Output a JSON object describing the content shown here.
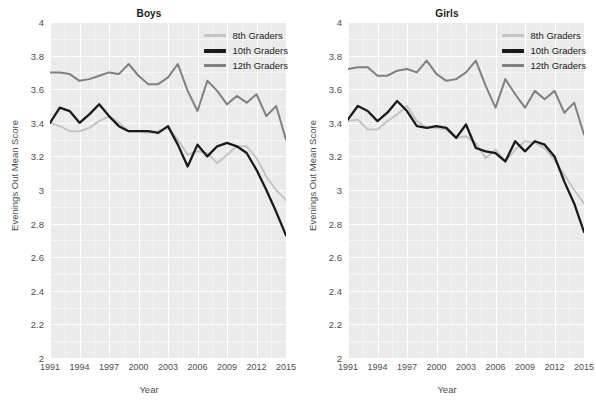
{
  "figure": {
    "ylabel": "Evenings Out Mean Score",
    "xlabel": "Year",
    "panels": [
      "Boys",
      "Girls"
    ]
  },
  "legend": {
    "items": [
      {
        "label": "8th Graders",
        "color": "#c4c4c4"
      },
      {
        "label": "10th Graders",
        "color": "#1a1a1a"
      },
      {
        "label": "12th Graders",
        "color": "#808080"
      }
    ]
  },
  "axes": {
    "y_ticks": [
      "2",
      "2.2",
      "2.4",
      "2.6",
      "2.8",
      "3",
      "3.2",
      "3.4",
      "3.6",
      "3.8",
      "4"
    ],
    "y_tick_values": [
      2,
      2.2,
      2.4,
      2.6,
      2.8,
      3,
      3.2,
      3.4,
      3.6,
      3.8,
      4
    ],
    "x_ticks": [
      "1991",
      "1994",
      "1997",
      "2000",
      "2003",
      "2006",
      "2009",
      "2012",
      "2015"
    ],
    "x_tick_values": [
      1991,
      1994,
      1997,
      2000,
      2003,
      2006,
      2009,
      2012,
      2015
    ]
  },
  "chart_data": [
    {
      "type": "line",
      "title": "Boys",
      "xlabel": "Year",
      "ylabel": "Evenings Out Mean Score",
      "xlim": [
        1991,
        2015
      ],
      "ylim": [
        2,
        4
      ],
      "grid": true,
      "legend_position": "top-right",
      "x": [
        1991,
        1992,
        1993,
        1994,
        1995,
        1996,
        1997,
        1998,
        1999,
        2000,
        2001,
        2002,
        2003,
        2004,
        2005,
        2006,
        2007,
        2008,
        2009,
        2010,
        2011,
        2012,
        2013,
        2014,
        2015
      ],
      "series": [
        {
          "name": "8th Graders",
          "color": "#c4c4c4",
          "values": [
            3.4,
            3.38,
            3.35,
            3.35,
            3.37,
            3.41,
            3.44,
            3.4,
            3.35,
            3.35,
            3.34,
            3.35,
            3.37,
            3.3,
            3.21,
            3.23,
            3.22,
            3.16,
            3.21,
            3.26,
            3.26,
            3.19,
            3.08,
            3.0,
            2.94
          ]
        },
        {
          "name": "10th Graders",
          "color": "#1a1a1a",
          "values": [
            3.4,
            3.49,
            3.47,
            3.4,
            3.45,
            3.51,
            3.44,
            3.38,
            3.35,
            3.35,
            3.35,
            3.34,
            3.38,
            3.27,
            3.14,
            3.27,
            3.2,
            3.26,
            3.28,
            3.26,
            3.22,
            3.12,
            3.0,
            2.87,
            2.73
          ]
        },
        {
          "name": "12th Graders",
          "color": "#808080",
          "values": [
            3.7,
            3.7,
            3.69,
            3.65,
            3.66,
            3.68,
            3.7,
            3.69,
            3.75,
            3.68,
            3.63,
            3.63,
            3.67,
            3.75,
            3.59,
            3.47,
            3.65,
            3.59,
            3.51,
            3.56,
            3.52,
            3.57,
            3.44,
            3.5,
            3.3
          ]
        }
      ]
    },
    {
      "type": "line",
      "title": "Girls",
      "xlabel": "Year",
      "ylabel": "Evenings Out Mean Score",
      "xlim": [
        1991,
        2015
      ],
      "ylim": [
        2,
        4
      ],
      "grid": true,
      "legend_position": "top-right",
      "x": [
        1991,
        1992,
        1993,
        1994,
        1995,
        1996,
        1997,
        1998,
        1999,
        2000,
        2001,
        2002,
        2003,
        2004,
        2005,
        2006,
        2007,
        2008,
        2009,
        2010,
        2011,
        2012,
        2013,
        2014,
        2015
      ],
      "series": [
        {
          "name": "8th Graders",
          "color": "#c4c4c4",
          "values": [
            3.41,
            3.42,
            3.36,
            3.36,
            3.41,
            3.45,
            3.5,
            3.41,
            3.37,
            3.37,
            3.36,
            3.31,
            3.32,
            3.28,
            3.19,
            3.24,
            3.17,
            3.24,
            3.29,
            3.28,
            3.25,
            3.18,
            3.09,
            3.0,
            2.92
          ]
        },
        {
          "name": "10th Graders",
          "color": "#1a1a1a",
          "values": [
            3.42,
            3.5,
            3.47,
            3.41,
            3.46,
            3.53,
            3.47,
            3.38,
            3.37,
            3.38,
            3.37,
            3.31,
            3.39,
            3.25,
            3.23,
            3.22,
            3.17,
            3.29,
            3.23,
            3.29,
            3.27,
            3.2,
            3.05,
            2.92,
            2.75
          ]
        },
        {
          "name": "12th Graders",
          "color": "#808080",
          "values": [
            3.72,
            3.73,
            3.73,
            3.68,
            3.68,
            3.71,
            3.72,
            3.7,
            3.77,
            3.69,
            3.65,
            3.66,
            3.7,
            3.77,
            3.62,
            3.49,
            3.66,
            3.57,
            3.49,
            3.59,
            3.54,
            3.59,
            3.46,
            3.52,
            3.33
          ]
        }
      ]
    }
  ]
}
